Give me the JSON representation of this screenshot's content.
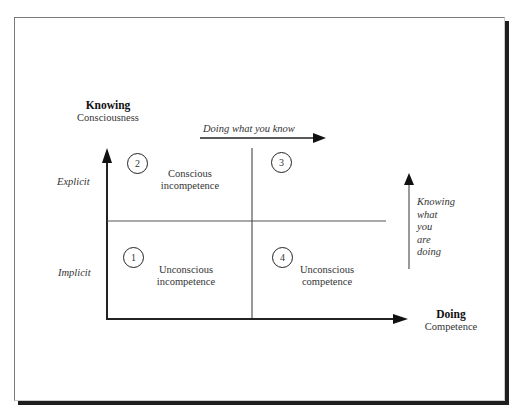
{
  "diagram": {
    "y_axis": {
      "title": "Knowing",
      "subtitle": "Consciousness"
    },
    "x_axis": {
      "title": "Doing",
      "subtitle": "Competence"
    },
    "row_labels": {
      "top": "Explicit",
      "bottom": "Implicit"
    },
    "top_arrow_label": "Doing what you know",
    "side_arrow_label": [
      "Knowing",
      "what",
      "you",
      "are",
      "doing"
    ],
    "quadrants": [
      {
        "number": "1",
        "line1": "Unconscious",
        "line2": "incompetence",
        "position": "bottom-left"
      },
      {
        "number": "2",
        "line1": "Conscious",
        "line2": "incompetence",
        "position": "top-left"
      },
      {
        "number": "3",
        "line1": "",
        "line2": "",
        "position": "top-right"
      },
      {
        "number": "4",
        "line1": "Unconscious",
        "line2": "competence",
        "position": "bottom-right"
      }
    ],
    "colors": {
      "line": "#222222",
      "divider": "#555555",
      "frame_shadow": "#1e1e1e"
    }
  }
}
